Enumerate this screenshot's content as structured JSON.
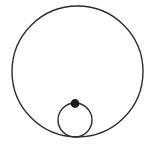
{
  "figure": {
    "background_color": "#ffffff",
    "stroke_color": "#2b2b2b",
    "fill_color": "#1a1a1a",
    "width": 153,
    "height": 147
  },
  "chart_data": {
    "type": "diagram",
    "shapes": [
      {
        "name": "large-circle",
        "type": "circle",
        "cx": 77.5,
        "cy": 71.5,
        "r": 65.5,
        "stroke": "#2b2b2b",
        "stroke_width": 1.4,
        "fill": "none"
      },
      {
        "name": "small-circle",
        "type": "circle",
        "cx": 75,
        "cy": 120,
        "r": 17,
        "stroke": "#2b2b2b",
        "stroke_width": 1.4,
        "fill": "none"
      },
      {
        "name": "marked-point",
        "type": "dot",
        "cx": 75,
        "cy": 103.5,
        "r": 4.4,
        "stroke": "none",
        "fill": "#1a1a1a"
      }
    ],
    "relations": [
      "small circle is internally tangent to large circle at the bottom",
      "marked point lies on the top of the small circle"
    ],
    "labels": [],
    "grid": false,
    "legend": null
  }
}
